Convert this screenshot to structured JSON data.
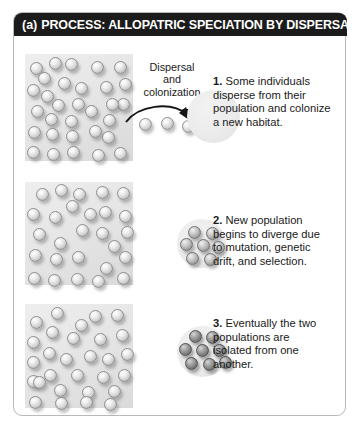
{
  "figure": {
    "panel_id": "(a)",
    "header_title": "PROCESS: ALLOPATRIC SPECIATION BY DISPERSAL",
    "header_bg": "#1b1b1b",
    "header_fg": "#ffffff",
    "border_color": "#b9b9b9",
    "background": "#ffffff"
  },
  "annotations": {
    "dispersal_line1": "Dispersal",
    "dispersal_line2": "and",
    "dispersal_line3": "colonization",
    "arrow_name": "dispersal-arrow"
  },
  "steps": [
    {
      "number": "1.",
      "text": "Some individuals disperse from their population and colonize a new habitat."
    },
    {
      "number": "2.",
      "text": "New population begins to diverge due to mutation, genetic drift, and selection."
    },
    {
      "number": "3.",
      "text": "Eventually the two populations are isolated from one another."
    }
  ],
  "graphics": {
    "source_population_label": "source-population-patch",
    "organism_colors": {
      "ancestral_light": "#d2d2d2",
      "diverging_mid": "#b2b2b2",
      "diverged_dark": "#8a8a8a",
      "habitat_patch": "#e6e6e6",
      "new_habitat_circle": "#ececec"
    },
    "rows": [
      {
        "row_index": 1,
        "patch_organism_count": 31,
        "patch_organism_shade": "ancestral_light",
        "dispersing_organism_count": 3,
        "dispersing_organism_shade": "ancestral_light",
        "new_population_count": 0,
        "new_population_shade": "ancestral_light"
      },
      {
        "row_index": 2,
        "patch_organism_count": 27,
        "patch_organism_shade": "ancestral_light",
        "dispersing_organism_count": 0,
        "dispersing_organism_shade": "ancestral_light",
        "new_population_count": 7,
        "new_population_shade": "diverging_mid"
      },
      {
        "row_index": 3,
        "patch_organism_count": 29,
        "patch_organism_shade": "ancestral_light",
        "dispersing_organism_count": 0,
        "dispersing_organism_shade": "ancestral_light",
        "new_population_count": 8,
        "new_population_shade": "diverged_dark"
      }
    ]
  }
}
